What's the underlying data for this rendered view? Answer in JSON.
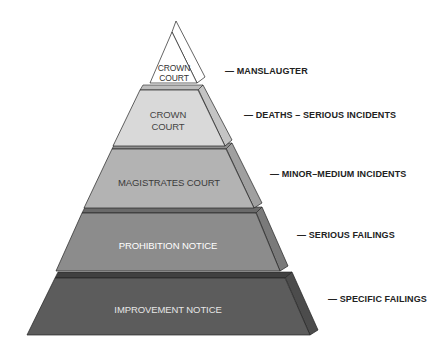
{
  "diagram": {
    "type": "enforcement-pyramid",
    "tiers": [
      {
        "level": 1,
        "label_lines": [
          "CROWN",
          "COURT"
        ],
        "description": "— MANSLAUGTER",
        "front_color": "#ffffff",
        "side_color": "#ffffff",
        "ledge_color": "#ffffff",
        "text_color": "#333333"
      },
      {
        "level": 2,
        "label_lines": [
          "CROWN",
          "COURT"
        ],
        "description": "— DEATHS – SERIOUS INCIDENTS",
        "front_color": "#d9d9d9",
        "side_color": "#c4c4c4",
        "ledge_color": "#bdbdbd",
        "text_color": "#444444"
      },
      {
        "level": 3,
        "label_lines": [
          "MAGISTRATES COURT"
        ],
        "description": "— MINOR–MEDIUM INCIDENTS",
        "front_color": "#b3b3b3",
        "side_color": "#a0a0a0",
        "ledge_color": "#8f8f8f",
        "text_color": "#3a3a3a"
      },
      {
        "level": 4,
        "label_lines": [
          "PROHIBITION NOTICE"
        ],
        "description": "— SERIOUS FAILINGS",
        "front_color": "#8c8c8c",
        "side_color": "#7a7a7a",
        "ledge_color": "#6a6a6a",
        "text_color": "#ffffff"
      },
      {
        "level": 5,
        "label_lines": [
          "IMPROVEMENT NOTICE"
        ],
        "description": "— SPECIFIC FAILINGS",
        "front_color": "#5c5c5c",
        "side_color": "#4c4c4c",
        "ledge_color": "#404040",
        "text_color": "#e6e6e6"
      }
    ]
  }
}
